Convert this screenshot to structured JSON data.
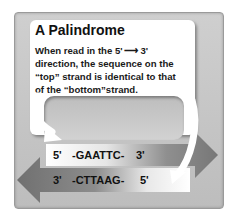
{
  "title": "A Palindrome",
  "description_lines": [
    "When read in the 5' ⟶ 3'",
    "direction, the sequence on the",
    "“top” strand is identical to that",
    "of the “bottom”strand."
  ],
  "top_strand": {
    "five_prime": "5'",
    "sequence": "-GAATTC-",
    "three_prime": "3'",
    "direction": "right"
  },
  "bottom_strand": {
    "three_prime": "3'",
    "sequence": "-CTTAAG-",
    "five_prime": "5'",
    "direction": "left"
  },
  "colors": {
    "frame": "#c4c4c4",
    "card": "#ffffff",
    "arrow_dark": "#7a7a7a",
    "arrow_light": "#ffffff",
    "text": "#111111"
  }
}
